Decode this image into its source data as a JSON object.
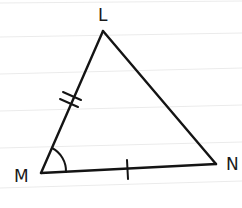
{
  "figure": {
    "type": "triangle",
    "vertices": {
      "L": {
        "label": "L",
        "x": 103,
        "y": 31
      },
      "M": {
        "label": "M",
        "x": 41,
        "y": 173
      },
      "N": {
        "label": "N",
        "x": 216,
        "y": 164
      }
    },
    "markings": {
      "side_LM": "double tick (congruent marks)",
      "side_MN": "single tick",
      "angle_M": "single arc"
    },
    "colors": {
      "stroke": "#141414",
      "ruled_lines": "#e6e6e6",
      "background": "#ffffff"
    }
  }
}
